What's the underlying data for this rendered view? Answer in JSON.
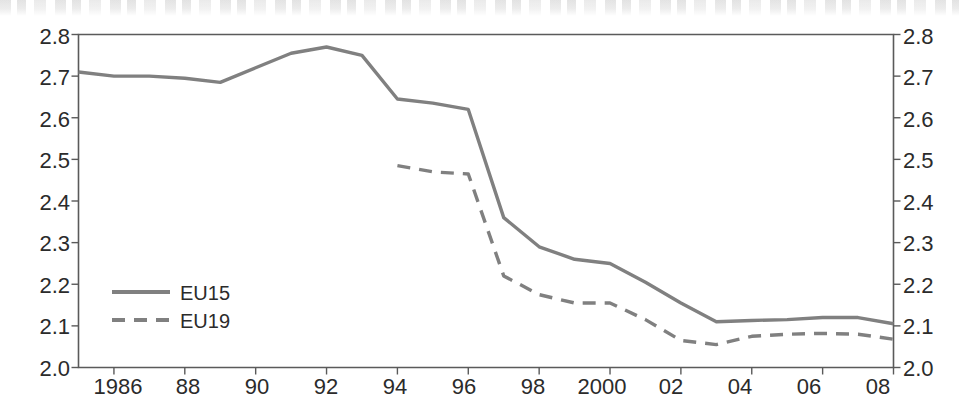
{
  "figure": {
    "width": 959,
    "height": 413,
    "background_color": "#ffffff",
    "line_color": "#808080",
    "axis_color": "#5a5a5a",
    "text_color": "#2b2b2b"
  },
  "legend": {
    "position": "inside-lower-left",
    "entries": [
      {
        "label": "EU15",
        "style": "solid"
      },
      {
        "label": "EU19",
        "style": "dashed"
      }
    ]
  },
  "chart_data": {
    "type": "line",
    "title": "",
    "subtitle": "",
    "xlabel": "",
    "ylabel": "",
    "xlim": [
      1985,
      2008
    ],
    "ylim": [
      2.0,
      2.8
    ],
    "grid": false,
    "legend_position": "inside-lower-left",
    "y_axis_duplicated_right": true,
    "x": [
      1985,
      1986,
      1987,
      1988,
      1989,
      1990,
      1991,
      1992,
      1993,
      1994,
      1995,
      1996,
      1997,
      1998,
      1999,
      2000,
      2001,
      2002,
      2003,
      2004,
      2005,
      2006,
      2007,
      2008
    ],
    "x_tick_values": [
      1986,
      1988,
      1990,
      1992,
      1994,
      1996,
      1998,
      2000,
      2002,
      2004,
      2006,
      2008
    ],
    "x_tick_labels": [
      "1986",
      "88",
      "90",
      "92",
      "94",
      "96",
      "98",
      "2000",
      "02",
      "04",
      "06",
      "08"
    ],
    "y_ticks": [
      2.0,
      2.1,
      2.2,
      2.3,
      2.4,
      2.5,
      2.6,
      2.7,
      2.8
    ],
    "y_tick_labels": [
      "2.0",
      "2.1",
      "2.2",
      "2.3",
      "2.4",
      "2.5",
      "2.6",
      "2.7",
      "2.8"
    ],
    "series": [
      {
        "name": "EU15",
        "style": "solid",
        "color": "#808080",
        "x": [
          1985,
          1986,
          1987,
          1988,
          1989,
          1990,
          1991,
          1992,
          1993,
          1994,
          1995,
          1996,
          1997,
          1998,
          1999,
          2000,
          2001,
          2002,
          2003,
          2004,
          2005,
          2006,
          2007,
          2008
        ],
        "values": [
          2.71,
          2.7,
          2.7,
          2.695,
          2.685,
          2.72,
          2.755,
          2.77,
          2.75,
          2.645,
          2.635,
          2.62,
          2.36,
          2.29,
          2.26,
          2.25,
          2.205,
          2.155,
          2.11,
          2.113,
          2.115,
          2.12,
          2.12,
          2.105
        ]
      },
      {
        "name": "EU19",
        "style": "dashed",
        "color": "#808080",
        "x": [
          1994,
          1995,
          1996,
          1997,
          1998,
          1999,
          2000,
          2001,
          2002,
          2003,
          2004,
          2005,
          2006,
          2007,
          2008
        ],
        "values": [
          2.485,
          2.47,
          2.465,
          2.22,
          2.175,
          2.155,
          2.155,
          2.115,
          2.065,
          2.055,
          2.075,
          2.08,
          2.082,
          2.08,
          2.068
        ]
      }
    ]
  },
  "axes": {
    "left_tick_labels": [
      "2.8",
      "2.7",
      "2.6",
      "2.5",
      "2.4",
      "2.3",
      "2.2",
      "2.1",
      "2.0"
    ],
    "right_tick_labels": [
      "2.8",
      "2.7",
      "2.6",
      "2.5",
      "2.4",
      "2.3",
      "2.2",
      "2.1",
      "2.0"
    ],
    "bottom_tick_labels": [
      "1986",
      "88",
      "90",
      "92",
      "94",
      "96",
      "98",
      "2000",
      "02",
      "04",
      "06",
      "08"
    ]
  }
}
